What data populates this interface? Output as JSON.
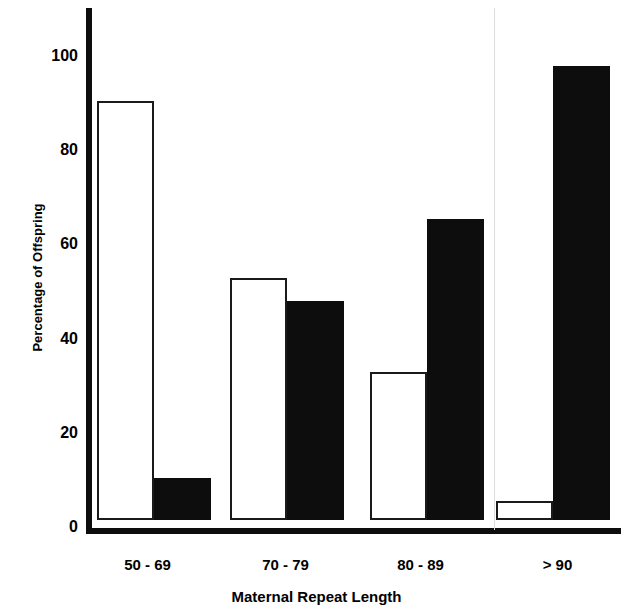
{
  "chart_data": {
    "type": "bar",
    "title": "",
    "xlabel": "Maternal Repeat Length",
    "ylabel": "Percentage of Offspring",
    "categories": [
      "50 - 69",
      "70 - 79",
      "80 - 89",
      "> 90"
    ],
    "series": [
      {
        "name": "open-bar",
        "fill": "white",
        "values": [
          89,
          51.5,
          31.5,
          4
        ]
      },
      {
        "name": "filled-bar",
        "fill": "black",
        "values": [
          9,
          46.5,
          64,
          96.5
        ]
      }
    ],
    "ylim": [
      0,
      112
    ],
    "yticks": [
      0,
      20,
      40,
      60,
      80,
      100
    ],
    "ytick_labels": [
      "0",
      "20",
      "40",
      "60",
      "80",
      "100"
    ],
    "grid": false,
    "legend": "none",
    "axis_color": "#0d0d0d",
    "open_bar_color": "#ffffff",
    "filled_bar_color": "#0d0d0d"
  },
  "axis": {
    "y_title": "Percentage of Offspring",
    "x_title": "Maternal Repeat Length",
    "ticks": {
      "t0": "0",
      "t20": "20",
      "t40": "40",
      "t60": "60",
      "t80": "80",
      "t100": "100"
    }
  },
  "groups": {
    "g0": "50 - 69",
    "g1": "70 - 79",
    "g2": "80 - 89",
    "g3": "> 90"
  }
}
